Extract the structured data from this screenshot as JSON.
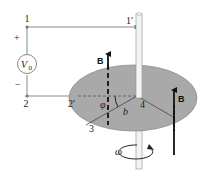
{
  "diagram": {
    "labels": {
      "node1": "1",
      "node1p": "1′",
      "node2": "2",
      "node2p": "2′",
      "node3": "3",
      "node4": "4",
      "plus": "+",
      "minus": "−",
      "source": "V",
      "source_sub": "0",
      "field_left": "B",
      "field_right": "B",
      "angle": "φ",
      "radius": "b",
      "omega": "ω"
    },
    "colors": {
      "disk": "#a9a9a9",
      "disk_edge": "#8e8e8e",
      "wire": "#8a8a8a",
      "arrow": "#111111",
      "shaft": "#f4f4f4",
      "node": "#777777",
      "background": "#ffffff"
    }
  }
}
